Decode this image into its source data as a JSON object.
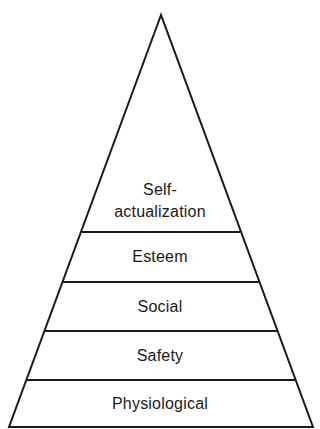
{
  "diagram": {
    "type": "pyramid",
    "line_color": "#1a1a1a",
    "text_color": "#1a1a1a",
    "background": "#ffffff",
    "apex": [
      161,
      15
    ],
    "base_left": [
      9,
      427
    ],
    "base_right": [
      313,
      427
    ],
    "levels": [
      {
        "label_line1": "Self-",
        "label_line2": "actualization",
        "top_y": 15,
        "bottom_y": 232
      },
      {
        "label": "Esteem",
        "top_y": 232,
        "bottom_y": 282
      },
      {
        "label": "Social",
        "top_y": 282,
        "bottom_y": 331
      },
      {
        "label": "Safety",
        "top_y": 331,
        "bottom_y": 380
      },
      {
        "label": "Physiological",
        "top_y": 380,
        "bottom_y": 427
      }
    ]
  }
}
